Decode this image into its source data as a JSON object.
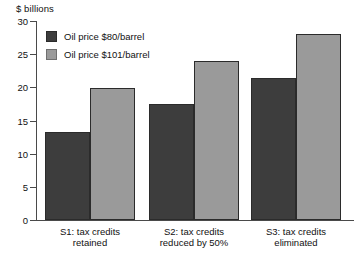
{
  "chart_data": {
    "type": "bar",
    "title": "",
    "subtitle": "",
    "xlabel": "",
    "ylabel": "$ billions",
    "ylim": [
      0,
      30
    ],
    "yticks": [
      0,
      5,
      10,
      15,
      20,
      25,
      30
    ],
    "grid": false,
    "legend_position": "inside-top-left",
    "categories": [
      "S1: tax credits retained",
      "S2: tax credits reduced by 50%",
      "S3: tax credits eliminated"
    ],
    "category_lines": [
      [
        "S1: tax credits",
        "retained"
      ],
      [
        "S2: tax credits",
        "reduced by 50%"
      ],
      [
        "S3: tax credits",
        "eliminated"
      ]
    ],
    "series": [
      {
        "name": "Oil price $80/barrel",
        "color": "#3d3d3d",
        "values": [
          13.3,
          17.5,
          21.4
        ]
      },
      {
        "name": "Oil price $101/barrel",
        "color": "#9a9a9a",
        "values": [
          19.9,
          24.0,
          28.0
        ]
      }
    ]
  },
  "axis": {
    "unit_label": "$ billions",
    "tick_labels": [
      "30",
      "25",
      "20",
      "15",
      "10",
      "5",
      "0"
    ]
  },
  "legend": {
    "items": [
      {
        "label": "Oil price $80/barrel",
        "swatch": "dark"
      },
      {
        "label": "Oil price $101/barrel",
        "swatch": "light"
      }
    ]
  },
  "colors": {
    "series_dark": "#3d3d3d",
    "series_light": "#9a9a9a",
    "axis": "#4a4a4a",
    "background": "#ffffff"
  }
}
